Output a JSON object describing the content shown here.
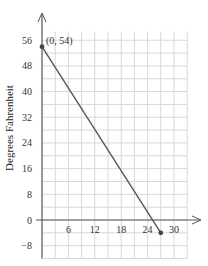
{
  "chart_data": {
    "type": "line",
    "title": "",
    "xlabel": "",
    "ylabel": "Degrees Fahrenheit",
    "xlim": [
      0,
      33
    ],
    "ylim": [
      -12,
      60
    ],
    "x_ticks": [
      6,
      12,
      18,
      24,
      30
    ],
    "y_ticks": [
      -8,
      0,
      8,
      16,
      24,
      32,
      40,
      48,
      56
    ],
    "grid": true,
    "x_grid_step": 3,
    "y_grid_step": 4,
    "series": [
      {
        "name": "temperature",
        "points": [
          [
            0,
            54
          ],
          [
            27,
            -4
          ]
        ],
        "color": "#555566"
      }
    ],
    "annotations": [
      {
        "text": "(0, 54)",
        "x": 0,
        "y": 54
      }
    ],
    "legend": null
  },
  "colors": {
    "grid": "#d8d8d8",
    "axis": "#555555",
    "line": "#555566",
    "point": "#444444"
  }
}
